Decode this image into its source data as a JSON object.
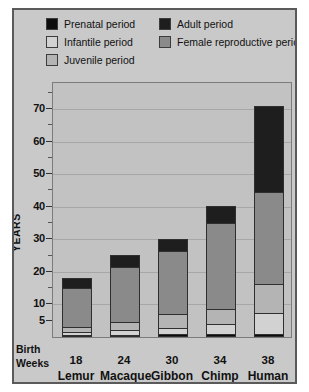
{
  "figure": {
    "background": "#c9c9c9",
    "plot_background": "#c2c2c2",
    "border_color": "#5a5a5a"
  },
  "legend": {
    "items": [
      {
        "label": "Prenatal period",
        "color": "#0d0d0d",
        "col": 1,
        "row": 1
      },
      {
        "label": "Infantile period",
        "color": "#d2d2d2",
        "col": 1,
        "row": 2
      },
      {
        "label": "Juvenile period",
        "color": "#b4b4b4",
        "col": 1,
        "row": 3
      },
      {
        "label": "Adult period",
        "color": "#1e1e1e",
        "col": 2,
        "row": 1
      },
      {
        "label": "Female reproductive period",
        "color": "#8a8a8a",
        "col": 2,
        "row": 2
      }
    ]
  },
  "axes": {
    "ylabel": "YEARS",
    "ylim": [
      0,
      78
    ],
    "ytick_labels": [
      5,
      10,
      20,
      30,
      40,
      50,
      60,
      70
    ],
    "yticks_minor": [
      15,
      25,
      35,
      45,
      55,
      65,
      75
    ],
    "gridlines": [
      10,
      20,
      30,
      40,
      50,
      60,
      70
    ],
    "birth_weeks_label_line1": "Birth",
    "birth_weeks_label_line2": "Weeks"
  },
  "chart_data": {
    "type": "bar",
    "title": "",
    "xlabel": "",
    "ylabel": "YEARS",
    "ylim": [
      0,
      78
    ],
    "grid": true,
    "legend_position": "top",
    "stacked": true,
    "categories": [
      "Lemur",
      "Macaque",
      "Gibbon",
      "Chimp",
      "Human"
    ],
    "birth_weeks": [
      18,
      24,
      30,
      34,
      38
    ],
    "segment_order": [
      "Prenatal period",
      "Infantile period",
      "Juvenile period",
      "Female reproductive period",
      "Adult period"
    ],
    "segment_colors": {
      "Prenatal period": "#0d0d0d",
      "Infantile period": "#d2d2d2",
      "Juvenile period": "#b4b4b4",
      "Female reproductive period": "#8a8a8a",
      "Adult period": "#1e1e1e"
    },
    "series": [
      {
        "name": "Prenatal period",
        "values": [
          0.35,
          0.45,
          0.6,
          0.65,
          0.75
        ]
      },
      {
        "name": "Infantile period",
        "values": [
          0.9,
          1.3,
          1.9,
          3.0,
          6.3
        ]
      },
      {
        "name": "Juvenile period",
        "values": [
          1.5,
          2.8,
          4.3,
          4.9,
          9.2
        ]
      },
      {
        "name": "Female reproductive period",
        "values": [
          12.6,
          17.1,
          19.7,
          26.8,
          28.3
        ]
      },
      {
        "name": "Adult period",
        "values": [
          2.9,
          3.5,
          3.6,
          4.9,
          26.5
        ]
      }
    ],
    "totals": [
      18.25,
      25.15,
      30.1,
      40.25,
      71.05
    ],
    "cumulative_tops": [
      {
        "category": "Lemur",
        "prenatal": 0.35,
        "infantile": 1.25,
        "juvenile": 2.75,
        "female_reproductive": 15.35,
        "adult": 18.25
      },
      {
        "category": "Macaque",
        "prenatal": 0.45,
        "infantile": 1.75,
        "juvenile": 4.55,
        "female_reproductive": 21.65,
        "adult": 25.15
      },
      {
        "category": "Gibbon",
        "prenatal": 0.6,
        "infantile": 2.5,
        "juvenile": 6.8,
        "female_reproductive": 26.5,
        "adult": 30.1
      },
      {
        "category": "Chimp",
        "prenatal": 0.65,
        "infantile": 3.65,
        "juvenile": 8.55,
        "female_reproductive": 35.35,
        "adult": 40.25
      },
      {
        "category": "Human",
        "prenatal": 0.75,
        "infantile": 7.05,
        "juvenile": 16.25,
        "female_reproductive": 44.55,
        "adult": 71.05
      }
    ]
  }
}
